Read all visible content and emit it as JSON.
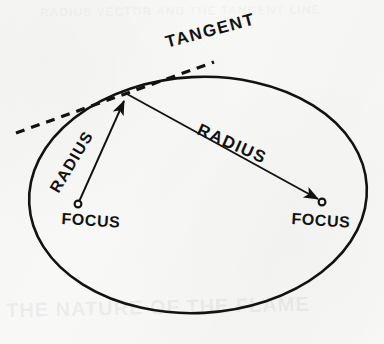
{
  "figure": {
    "name": "ellipse-focus-radius-tangent-diagram",
    "background_color": "#f8f8f6",
    "ink_color": "#121212",
    "width": 384,
    "height": 344
  },
  "labels": {
    "tangent": "TANGENT",
    "radius_left": "RADIUS",
    "radius_right": "RADIUS",
    "focus_left": "FOCUS",
    "focus_right": "FOCUS"
  },
  "ghost_text": {
    "bottom": "THE NATURE OF THE FLAME",
    "top": "RADIUS VECTOR AND THE TANGENT LINE"
  },
  "geometry": {
    "ellipse": {
      "center_x": 198,
      "center_y": 195,
      "radius_x": 169,
      "radius_y": 118,
      "rotation_deg": -3,
      "stroke_width": 2.6
    },
    "tangency_point": {
      "x": 127,
      "y": 94
    },
    "focus_left": {
      "x": 78,
      "y": 204,
      "marker_radius": 3.4
    },
    "focus_right": {
      "x": 322,
      "y": 202,
      "marker_radius": 3.4
    },
    "tangent_line": {
      "x1": 16,
      "y1": 133,
      "x2": 214,
      "y2": 62,
      "dash_pattern": "9 7",
      "stroke_width": 3.2
    },
    "radius_left_line": {
      "x1": 78,
      "y1": 204,
      "x2": 127,
      "y2": 94,
      "arrow_at": "tangency-point"
    },
    "radius_right_line": {
      "x1": 127,
      "y1": 94,
      "x2": 322,
      "y2": 202,
      "arrow_at": "focus-right"
    }
  }
}
